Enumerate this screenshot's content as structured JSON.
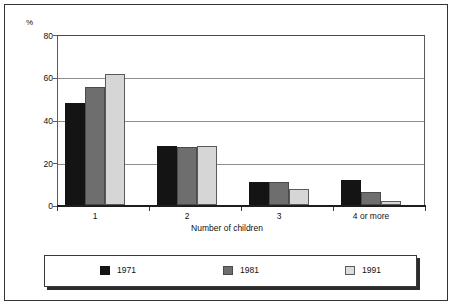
{
  "chart_data": {
    "type": "bar",
    "title": "",
    "subtitle": "",
    "xlabel": "Number of children",
    "ylabel": "%",
    "categories": [
      "1",
      "2",
      "3",
      "4 or more"
    ],
    "series": [
      {
        "name": "1971",
        "color": "#141414",
        "values": [
          48.5,
          28,
          11,
          12
        ]
      },
      {
        "name": "1981",
        "color": "#6e6e6e",
        "values": [
          56,
          27.5,
          11,
          6
        ]
      },
      {
        "name": "1991",
        "color": "#d6d6d6",
        "values": [
          62,
          28,
          7.5,
          2
        ]
      }
    ],
    "ylim": [
      0,
      80
    ],
    "yticks": [
      0,
      20,
      40,
      60,
      80
    ],
    "ytick_labels": [
      "0",
      "20",
      "40",
      "60",
      "80"
    ],
    "grid": true,
    "legend_position": "bottom"
  },
  "axis": {
    "unit_label": "%",
    "y_labels": [
      "80",
      "60",
      "40",
      "20",
      "0"
    ],
    "x_labels": [
      "1",
      "2",
      "3",
      "4 or more"
    ],
    "x_title": "Number of children"
  },
  "legend": {
    "items": [
      {
        "label": "1971"
      },
      {
        "label": "1981"
      },
      {
        "label": "1991"
      }
    ]
  }
}
